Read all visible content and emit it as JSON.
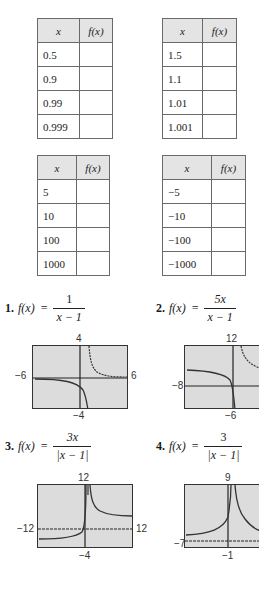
{
  "tables": [
    {
      "header": [
        "x",
        "f(x)"
      ],
      "rows": [
        [
          "0.5",
          ""
        ],
        [
          "0.9",
          ""
        ],
        [
          "0.99",
          ""
        ],
        [
          "0.999",
          ""
        ]
      ]
    },
    {
      "header": [
        "x",
        "f(x)"
      ],
      "rows": [
        [
          "1.5",
          ""
        ],
        [
          "1.1",
          ""
        ],
        [
          "1.01",
          ""
        ],
        [
          "1.001",
          ""
        ]
      ]
    },
    {
      "header": [
        "x",
        "f(x)"
      ],
      "rows": [
        [
          "5",
          ""
        ],
        [
          "10",
          ""
        ],
        [
          "100",
          ""
        ],
        [
          "1000",
          ""
        ]
      ]
    },
    {
      "header": [
        "x",
        "f(x)"
      ],
      "rows": [
        [
          "−5",
          ""
        ],
        [
          "−10",
          ""
        ],
        [
          "−100",
          ""
        ],
        [
          "−1000",
          ""
        ]
      ]
    }
  ],
  "problems": [
    {
      "number": "1.",
      "lhs": "f(x)",
      "eq": "=",
      "numerator": "1",
      "denominator": "x − 1",
      "window": {
        "ymax": "4",
        "ymin": "−4",
        "xmin": "−6",
        "xmax": "6"
      }
    },
    {
      "number": "2.",
      "lhs": "f(x)",
      "eq": "=",
      "numerator": "5x",
      "denominator": "x − 1",
      "window": {
        "ymax": "12",
        "ymin": "−6",
        "xmin": "−8",
        "xmax": ""
      }
    },
    {
      "number": "3.",
      "lhs": "f(x)",
      "eq": "=",
      "numerator": "3x",
      "denominator": "|x − 1|",
      "window": {
        "ymax": "12",
        "ymin": "−4",
        "xmin": "−12",
        "xmax": "12"
      }
    },
    {
      "number": "4.",
      "lhs": "f(x)",
      "eq": "=",
      "numerator": "3",
      "denominator": "|x − 1|",
      "window": {
        "ymax": "9",
        "ymin": "−1",
        "xmin": "−7",
        "xmax": ""
      }
    }
  ],
  "colors": {
    "graph_bg": "#dcdcdc",
    "header_bg": "#e4e4e4",
    "border": "#6a6a6a"
  }
}
